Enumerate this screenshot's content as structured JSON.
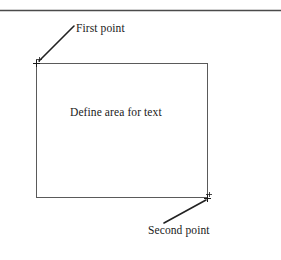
{
  "figure": {
    "title_rule": {
      "name": "top-horizontal-rule",
      "color": "#4a4a4a"
    },
    "area_box": {
      "label": "Define area for text",
      "stroke_color": "#5a5a5a",
      "x": 36,
      "y": 63,
      "width": 172,
      "height": 135
    },
    "annotations": [
      {
        "id": "first-point",
        "label": "First point",
        "marker": "plus-crosshair",
        "marker_x": 36,
        "marker_y": 63,
        "leader_from_x": 39,
        "leader_from_y": 61,
        "leader_to_x": 74,
        "leader_to_y": 26
      },
      {
        "id": "second-point",
        "label": "Second point",
        "marker": "plus-crosshair",
        "marker_x": 208,
        "marker_y": 198,
        "leader_from_x": 164,
        "leader_from_y": 223,
        "leader_to_x": 206,
        "leader_to_y": 200
      }
    ],
    "colors": {
      "background": "#ffffff",
      "text": "#1a1a1a",
      "box_stroke": "#5a5a5a",
      "leader_stroke": "#222222",
      "rule_stroke": "#4a4a4a"
    }
  }
}
